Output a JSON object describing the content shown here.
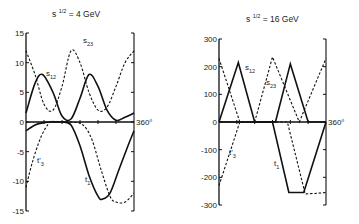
{
  "chart_data": [
    {
      "type": "line",
      "title": "s^1/2 = 4 GeV",
      "title_base": "s",
      "title_sup": "1/2",
      "title_rest": "= 4 GeV",
      "xlabel": "",
      "x_end_label": "360°",
      "xlim": [
        0,
        360
      ],
      "ylim": [
        -15,
        15
      ],
      "yticks": [
        "15",
        "10",
        "5",
        "0",
        "-5",
        "-10",
        "-15"
      ],
      "series": [
        {
          "name": "s12",
          "label_base": "s",
          "label_sub": "12",
          "style": "solid",
          "x": [
            0,
            30,
            55,
            90,
            120,
            150,
            180,
            210,
            240,
            270,
            300,
            330,
            360
          ],
          "values": [
            1.5,
            6.5,
            8,
            5,
            1,
            0.5,
            4,
            8,
            6,
            2,
            0.3,
            0.8,
            1.5
          ]
        },
        {
          "name": "s23",
          "label_base": "s",
          "label_sub": "23",
          "style": "dashed",
          "x": [
            0,
            30,
            60,
            90,
            120,
            150,
            180,
            210,
            240,
            270,
            300,
            330,
            360
          ],
          "values": [
            12,
            8,
            3,
            2,
            6,
            12,
            10,
            5,
            2,
            2.5,
            6,
            10,
            12
          ]
        },
        {
          "name": "t1",
          "label_base": "t",
          "label_sub": "1",
          "style": "solid",
          "x": [
            0,
            30,
            60,
            90,
            120,
            150,
            180,
            210,
            240,
            255,
            280,
            310,
            340,
            360
          ],
          "values": [
            -1.5,
            -0.5,
            -0.1,
            0,
            0,
            -0.5,
            -4,
            -9,
            -12.5,
            -13,
            -12,
            -8,
            -4,
            -1.5
          ]
        },
        {
          "name": "t'3",
          "label_base": "t'",
          "label_sub": "3",
          "style": "dashed",
          "x": [
            0,
            20,
            50,
            80,
            100,
            150,
            190,
            220,
            250,
            280,
            300,
            330,
            360
          ],
          "values": [
            -11,
            -7,
            -2.5,
            0,
            0,
            0,
            -0.5,
            -3,
            -8,
            -12.5,
            -13.5,
            -13.5,
            -12
          ]
        }
      ]
    },
    {
      "type": "line",
      "title": "s^1/2 = 16 GeV",
      "title_base": "s",
      "title_sup": "1/2",
      "title_rest": "= 16 GeV",
      "xlabel": "",
      "x_end_label": "360°",
      "xlim": [
        0,
        360
      ],
      "ylim": [
        -300,
        300
      ],
      "yticks": [
        "300",
        "200",
        "100",
        "0",
        "-100",
        "-200",
        "-300"
      ],
      "series": [
        {
          "name": "s12",
          "label_base": "s",
          "label_sub": "12",
          "style": "solid",
          "x": [
            0,
            65,
            120,
            190,
            240,
            300,
            360
          ],
          "values": [
            0,
            215,
            0,
            0,
            210,
            0,
            0
          ]
        },
        {
          "name": "s23",
          "label_base": "s",
          "label_sub": "23",
          "style": "dashed",
          "x": [
            0,
            70,
            120,
            180,
            270,
            360
          ],
          "values": [
            230,
            0,
            0,
            235,
            0,
            230
          ]
        },
        {
          "name": "t1",
          "label_base": "t",
          "label_sub": "1",
          "style": "solid",
          "x": [
            0,
            180,
            235,
            285,
            360
          ],
          "values": [
            0,
            0,
            -255,
            -255,
            0
          ]
        },
        {
          "name": "t'3",
          "label_base": "t'",
          "label_sub": "3",
          "style": "dashed",
          "x": [
            0,
            70,
            230,
            290,
            325,
            360
          ],
          "values": [
            -230,
            0,
            0,
            -260,
            -258,
            -255
          ]
        }
      ]
    }
  ]
}
